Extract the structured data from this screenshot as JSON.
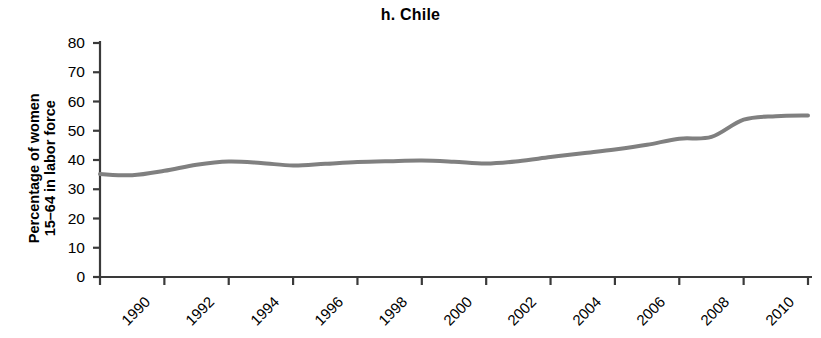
{
  "chart_data": {
    "type": "line",
    "title": "h. Chile",
    "xlabel": "",
    "ylabel": "Percentage of women 15–64 in labor force",
    "ylabel_lines": [
      "Percentage of women",
      "15–64 in labor force"
    ],
    "xlim": [
      1990,
      2012
    ],
    "ylim": [
      0,
      80
    ],
    "yticks": [
      0,
      10,
      20,
      30,
      40,
      50,
      60,
      70,
      80
    ],
    "ytick_labels": [
      "0",
      "10",
      "20",
      "30",
      "40",
      "50",
      "60",
      "70",
      "80"
    ],
    "xticks": [
      1990,
      1992,
      1994,
      1996,
      1998,
      2000,
      2002,
      2004,
      2006,
      2008,
      2010,
      2012
    ],
    "xtick_labels": [
      "1990",
      "1992",
      "1994",
      "1996",
      "1998",
      "2000",
      "2002",
      "2004",
      "2006",
      "2008",
      "2010",
      "2012"
    ],
    "grid": false,
    "legend": false,
    "legend_position": "none",
    "line_color": "#808080",
    "axis_color": "#3a3a3a",
    "line_width": 4,
    "x": [
      1990,
      1991,
      1992,
      1993,
      1994,
      1995,
      1996,
      1997,
      1998,
      1999,
      2000,
      2001,
      2002,
      2003,
      2004,
      2005,
      2006,
      2007,
      2008,
      2009,
      2010,
      2011,
      2012
    ],
    "values": [
      35.2,
      34.8,
      36.3,
      38.4,
      39.5,
      39.0,
      38.1,
      38.7,
      39.3,
      39.6,
      39.8,
      39.4,
      38.8,
      39.6,
      41.0,
      42.3,
      43.6,
      45.2,
      47.3,
      47.9,
      53.8,
      55.0,
      55.2
    ],
    "series": [
      {
        "name": "Chile",
        "values": [
          35.2,
          34.8,
          36.3,
          38.4,
          39.5,
          39.0,
          38.1,
          38.7,
          39.3,
          39.6,
          39.8,
          39.4,
          38.8,
          39.6,
          41.0,
          42.3,
          43.6,
          45.2,
          47.3,
          47.9,
          53.8,
          55.0,
          55.2
        ]
      }
    ]
  }
}
